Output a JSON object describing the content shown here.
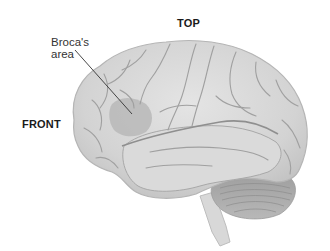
{
  "figure": {
    "labels": {
      "top": "TOP",
      "front": "FRONT",
      "broca_line1": "Broca's",
      "broca_line2": "area"
    },
    "highlighted_region": "Broca's area",
    "colors": {
      "background": "#ffffff",
      "brain_fill": "#d6d6d6",
      "brain_highlight": "#e8e8e8",
      "sulci": "#9a9a9a",
      "broca_region": "#b4b4b4",
      "cerebellum": "#a9a9a9",
      "leader_line": "#333333",
      "text": "#1a1a1a"
    }
  }
}
